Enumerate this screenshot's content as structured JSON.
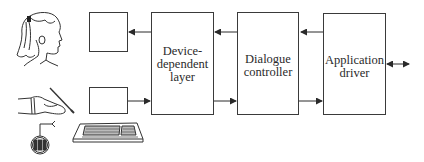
{
  "diagram": {
    "type": "block-diagram",
    "blocks": [
      {
        "id": "output-device",
        "label": "",
        "x": 89,
        "y": 12,
        "w": 39,
        "h": 40
      },
      {
        "id": "input-device",
        "label": "",
        "x": 89,
        "y": 87,
        "w": 39,
        "h": 27
      },
      {
        "id": "device-dependent-layer",
        "lines": [
          "Device-",
          "dependent",
          "layer"
        ],
        "x": 151,
        "y": 12,
        "w": 63,
        "h": 103
      },
      {
        "id": "dialogue-controller",
        "lines": [
          "Dialogue",
          "controller"
        ],
        "x": 237,
        "y": 12,
        "w": 62,
        "h": 103
      },
      {
        "id": "application-driver",
        "lines": [
          "Application",
          "driver"
        ],
        "x": 323,
        "y": 13,
        "w": 63,
        "h": 102
      }
    ],
    "arrows": [
      {
        "from": "device-dependent-layer",
        "to": "output-device",
        "y": 32
      },
      {
        "from": "input-device",
        "to": "device-dependent-layer",
        "y": 101
      },
      {
        "from": "dialogue-controller",
        "to": "device-dependent-layer",
        "y": 32
      },
      {
        "from": "device-dependent-layer",
        "to": "dialogue-controller",
        "y": 101
      },
      {
        "from": "application-driver",
        "to": "dialogue-controller",
        "y": 32
      },
      {
        "from": "dialogue-controller",
        "to": "application-driver",
        "y": 101
      },
      {
        "from": "application-driver",
        "to": "external",
        "bidirectional": true,
        "y": 64
      }
    ],
    "illustrations": [
      "person-head-icon",
      "hand-with-pen-icon",
      "joystick-controller-icon",
      "keyboard-icon"
    ],
    "colors": {
      "line": "#3a3a3a",
      "background": "#ffffff"
    }
  }
}
